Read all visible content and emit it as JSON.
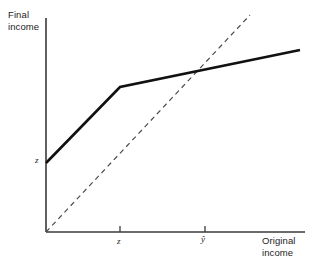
{
  "chart_data": {
    "type": "line",
    "title": "",
    "xlabel": "Original\nincome",
    "ylabel": "Final\nincome",
    "grid": false,
    "legend": null,
    "axis_origin_px": [
      46,
      232
    ],
    "xlim_px": [
      46,
      305
    ],
    "ylim_px": [
      232,
      18
    ],
    "xticks": [
      {
        "label": "z",
        "x_px": 120
      },
      {
        "label": "ŷ",
        "x_px": 205
      }
    ],
    "yticks": [],
    "annotations": [
      {
        "label": "z",
        "x_px": 39,
        "y_px": 163,
        "desc": "y-axis intercept of benefit schedule"
      }
    ],
    "series": [
      {
        "name": "net-income-schedule",
        "style": "solid",
        "width_px": 2.6,
        "color": "#111111",
        "points_px": [
          [
            46,
            163
          ],
          [
            120,
            87
          ],
          [
            300,
            50
          ]
        ]
      },
      {
        "name": "45-degree-line",
        "style": "dashed",
        "width_px": 1.2,
        "color": "#4a4a4a",
        "points_px": [
          [
            46,
            232
          ],
          [
            250,
            15
          ]
        ]
      }
    ],
    "crossing_point_px": [
      205,
      73
    ]
  },
  "labels": {
    "y_axis_title": "Final\nincome",
    "x_axis_title": "Original\nincome",
    "tick_z": "z",
    "tick_yhat": "ŷ",
    "intercept_z": "z"
  },
  "colors": {
    "background": "#ffffff",
    "axis": "#3a3a3a",
    "solid_line": "#111111",
    "dashed_line": "#4a4a4a",
    "text": "#1c1c1c"
  }
}
